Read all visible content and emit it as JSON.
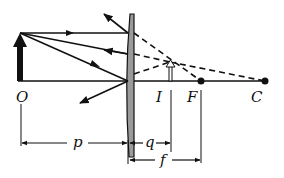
{
  "diagram": {
    "colors": {
      "ink": "#111111",
      "lens_fill": "#9a9a9a",
      "background": "#ffffff"
    },
    "labels": {
      "object": "O",
      "image": "I",
      "focal_point": "F",
      "center_of_curvature": "C",
      "object_distance": "p",
      "image_distance": "q",
      "focal_length": "f"
    },
    "elements": {
      "object_arrow": "solid upright arrow (real object)",
      "image_arrow": "hollow upright arrow (virtual image)",
      "lens": "diverging lens (plano-concave)",
      "rays": "3 incident solid rays, refracted solid rays, dashed back-extensions to image",
      "points": [
        "F",
        "C"
      ]
    }
  }
}
